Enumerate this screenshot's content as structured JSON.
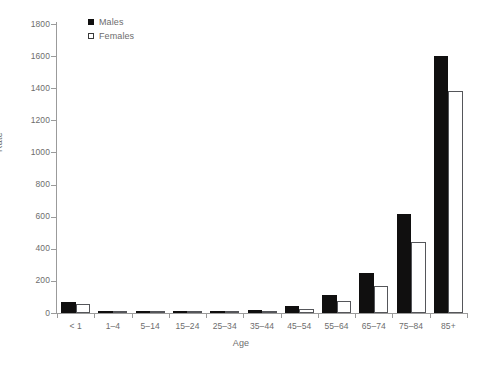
{
  "chart_data": {
    "type": "bar",
    "title": "",
    "xlabel": "Age",
    "ylabel": "Rate",
    "ylim": [
      0,
      1800
    ],
    "yticks": [
      0,
      200,
      400,
      600,
      800,
      1000,
      1200,
      1400,
      1600,
      1800
    ],
    "ytick_labels": [
      "0",
      "200",
      "400",
      "600",
      "800",
      "1000",
      "1200",
      "1400",
      "1600",
      "1800"
    ],
    "grid": false,
    "legend_position": "top-left",
    "categories": [
      "< 1",
      "1–4",
      "5–14",
      "15–24",
      "25–34",
      "35–44",
      "45–54",
      "55–64",
      "65–74",
      "75–84",
      "85+"
    ],
    "series": [
      {
        "name": "Males",
        "color": "#100f0f",
        "style": "filled",
        "values": [
          70,
          2,
          2,
          8,
          10,
          20,
          45,
          115,
          250,
          615,
          1600
        ]
      },
      {
        "name": "Females",
        "color": "#ffffff",
        "edge_color": "#55565a",
        "style": "open",
        "values": [
          55,
          2,
          1,
          5,
          6,
          10,
          25,
          75,
          170,
          440,
          1380
        ]
      }
    ]
  },
  "axes": {
    "x_title": "Age",
    "y_title": "Rate"
  },
  "colors": {
    "male_fill": "#100f0f",
    "female_fill": "#ffffff",
    "female_edge": "#55565a",
    "axis": "#9b9b9b",
    "text": "#6d6d6d",
    "background": "#ffffff"
  }
}
